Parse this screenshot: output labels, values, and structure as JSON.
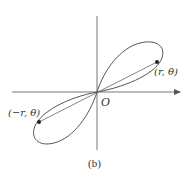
{
  "figure": {
    "caption": "(b)",
    "origin_label": "O",
    "point_positive_label": "(r, θ)",
    "point_negative_label": "(−r, θ)",
    "colors": {
      "stroke": "#555555",
      "axis": "#666666",
      "text": "#333333",
      "background": "#ffffff"
    }
  }
}
